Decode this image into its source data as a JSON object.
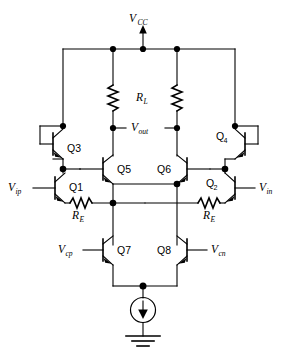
{
  "figure": {
    "type": "circuit-schematic",
    "background_color": "#ffffff",
    "line_color": "#000000",
    "width": 285,
    "height": 357
  },
  "supply": {
    "label": "V",
    "sub": "CC",
    "name": "vcc-rail"
  },
  "output": {
    "label": "V",
    "sub": "out",
    "name": "vout-node"
  },
  "load_resistors": {
    "label": "R",
    "sub": "L",
    "count": 2,
    "symbol": "zigzag-vertical"
  },
  "emitter_resistors": {
    "label": "R",
    "sub": "E",
    "count": 2,
    "symbol": "zigzag-horizontal",
    "left_name": "re-left",
    "right_name": "re-right"
  },
  "inputs": [
    {
      "name": "vip-terminal",
      "label": "V",
      "sub": "ip",
      "side": "left"
    },
    {
      "name": "vin-terminal",
      "label": "V",
      "sub": "in",
      "side": "right"
    },
    {
      "name": "vcp-terminal",
      "label": "V",
      "sub": "cp",
      "side": "left"
    },
    {
      "name": "vcn-terminal",
      "label": "V",
      "sub": "cn",
      "side": "right"
    }
  ],
  "transistors": [
    {
      "name": "transistor-q3",
      "label": "Q3",
      "base": "Q",
      "sub": "3",
      "type": "npn",
      "config": "diode-connected",
      "orientation": "left"
    },
    {
      "name": "transistor-q4",
      "label": "Q4",
      "base": "Q",
      "sub": "4",
      "type": "npn",
      "config": "diode-connected",
      "orientation": "right"
    },
    {
      "name": "transistor-q5",
      "label": "Q5",
      "base": "Q",
      "sub": "5",
      "type": "npn",
      "config": "emitter-follower",
      "orientation": "left"
    },
    {
      "name": "transistor-q6",
      "label": "Q6",
      "base": "Q",
      "sub": "6",
      "type": "npn",
      "config": "emitter-follower",
      "orientation": "right"
    },
    {
      "name": "transistor-q1",
      "label": "Q1",
      "base": "Q",
      "sub": "1",
      "type": "npn",
      "config": "differential-pair",
      "orientation": "left"
    },
    {
      "name": "transistor-q2",
      "label": "Q2",
      "base": "Q",
      "sub": "2",
      "type": "npn",
      "config": "differential-pair",
      "orientation": "right"
    },
    {
      "name": "transistor-q7",
      "label": "Q7",
      "base": "Q",
      "sub": "7",
      "type": "npn",
      "config": "tail-pair",
      "orientation": "left"
    },
    {
      "name": "transistor-q8",
      "label": "Q8",
      "base": "Q",
      "sub": "8",
      "type": "npn",
      "config": "tail-pair",
      "orientation": "right"
    }
  ],
  "current_source": {
    "name": "tail-current-source",
    "symbol": "circle-with-down-arrow"
  },
  "ground": {
    "name": "ground-symbol",
    "symbol": "three-bar-ground"
  }
}
